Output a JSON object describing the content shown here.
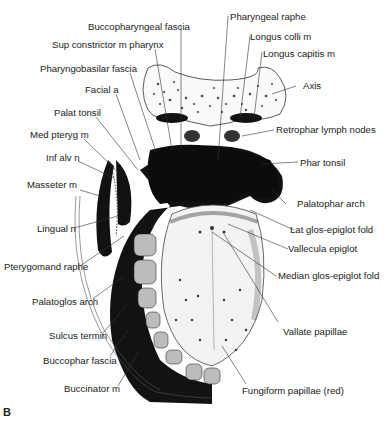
{
  "figure": {
    "panel_letter": "B",
    "labels_left": [
      {
        "id": "buccopharyngeal_fascia",
        "text": "Buccopharyngeal fascia"
      },
      {
        "id": "sup_constrictor",
        "text": "Sup constrictor m pharynx"
      },
      {
        "id": "pharyngobasilar_fascia",
        "text": "Pharyngobasilar fascia"
      },
      {
        "id": "facial_a",
        "text": "Facial a"
      },
      {
        "id": "palat_tonsil",
        "text": "Palat tonsil"
      },
      {
        "id": "med_pteryg",
        "text": "Med pteryg m"
      },
      {
        "id": "inf_alv_n",
        "text": "Inf alv n"
      },
      {
        "id": "masseter",
        "text": "Masseter m"
      },
      {
        "id": "lingual_n",
        "text": "Lingual n"
      },
      {
        "id": "pterygomand_raphe",
        "text": "Pterygomand raphe"
      },
      {
        "id": "palatoglos_arch",
        "text": "Palatoglos arch"
      },
      {
        "id": "sulcus_termin",
        "text": "Sulcus termin"
      },
      {
        "id": "buccophar_fascia",
        "text": "Buccophar fascia"
      },
      {
        "id": "buccinator",
        "text": "Buccinator m"
      }
    ],
    "labels_right": [
      {
        "id": "pharyngeal_raphe",
        "text": "Pharyngeal raphe"
      },
      {
        "id": "longus_colli",
        "text": "Longus colli m"
      },
      {
        "id": "longus_capitis",
        "text": "Longus capitis m"
      },
      {
        "id": "axis",
        "text": "Axis"
      },
      {
        "id": "retrophar_lymph",
        "text": "Retrophar lymph nodes"
      },
      {
        "id": "phar_tonsil",
        "text": "Phar tonsil"
      },
      {
        "id": "palatophar_arch",
        "text": "Palatophar arch"
      },
      {
        "id": "lat_glos_epiglot",
        "text": "Lat glos-epiglot fold"
      },
      {
        "id": "vallecula",
        "text": "Vallecula epiglot"
      },
      {
        "id": "median_glos_epiglot",
        "text": "Median glos-epiglot fold"
      },
      {
        "id": "vallate_papillae",
        "text": "Vallate papillae"
      },
      {
        "id": "fungiform_papillae",
        "text": "Fungiform papillae (red)"
      }
    ]
  }
}
